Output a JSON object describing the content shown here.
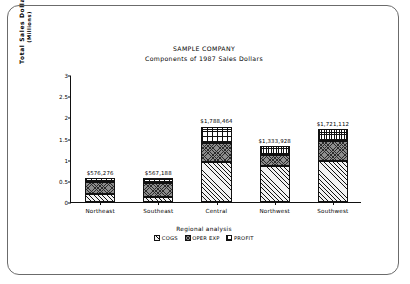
{
  "chart_data": {
    "type": "bar",
    "stacked": true,
    "title": "SAMPLE COMPANY",
    "subtitle": "Components of 1987 Sales Dollars",
    "xlabel": "",
    "ylabel": "Total Sales Dollars",
    "ylabel_unit": "(Millions)",
    "categories": [
      "Northeast",
      "Southeast",
      "Central",
      "Northwest",
      "Southwest"
    ],
    "ylim": [
      0,
      3
    ],
    "yticks": [
      "0",
      "0.5",
      "1",
      "1.5",
      "2",
      "2.5",
      "3"
    ],
    "ytick_values": [
      0,
      0.5,
      1,
      1.5,
      2,
      2.5,
      3
    ],
    "grid": false,
    "legend_title": "Regional analysis",
    "legend_position": "bottom",
    "series": [
      {
        "name": "COGS",
        "pattern": "diagonal-hatch",
        "values": [
          0.2,
          0.13,
          0.95,
          0.85,
          0.98
        ]
      },
      {
        "name": "OPER EXP",
        "pattern": "cross-hatch",
        "values": [
          0.28,
          0.33,
          0.45,
          0.25,
          0.45
        ]
      },
      {
        "name": "PROFIT",
        "pattern": "dotted-grid",
        "values": [
          0.08,
          0.1,
          0.38,
          0.23,
          0.29
        ]
      }
    ],
    "bar_totals": [
      0.576276,
      0.567188,
      1.788464,
      1.333928,
      1.721112
    ],
    "data_labels": [
      "$576,276",
      "$567,188",
      "$1,788,464",
      "$1,333,928",
      "$1,721,112"
    ]
  }
}
